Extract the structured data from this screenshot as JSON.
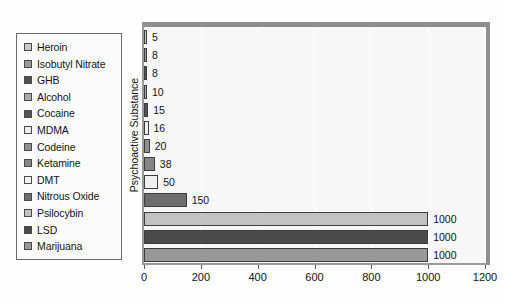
{
  "chart_data": {
    "type": "bar",
    "orientation": "horizontal",
    "title": "",
    "xlabel": "",
    "ylabel": "Psychoactive Substance",
    "xlim": [
      0,
      1200
    ],
    "xticks": [
      0,
      200,
      400,
      600,
      800,
      1000,
      1200
    ],
    "grid": true,
    "legend_position": "left-outside",
    "categories": [
      "Heroin",
      "Isobutyl Nitrate",
      "GHB",
      "Alcohol",
      "Cocaine",
      "MDMA",
      "Codeine",
      "Ketamine",
      "DMT",
      "Nitrous Oxide",
      "Psilocybin",
      "LSD",
      "Marijuana"
    ],
    "values": [
      5,
      8,
      8,
      10,
      15,
      16,
      20,
      38,
      50,
      150,
      1000,
      1000,
      1000
    ],
    "value_labels": [
      "5",
      "8",
      "8",
      "10",
      "15",
      "16",
      "20",
      "38",
      "50",
      "150",
      "1000",
      "1000",
      "1000"
    ],
    "bar_colors": [
      "#c8c8c8",
      "#9a9a9a",
      "#4f4f4f",
      "#a8a8a8",
      "#555555",
      "#ededed",
      "#8f8f8f",
      "#858585",
      "#f0f0f0",
      "#6d6d6d",
      "#c2c2c2",
      "#4a4a4a",
      "#989898"
    ]
  },
  "legend": {
    "items": [
      {
        "label": "Heroin",
        "color": "#c8c8c8"
      },
      {
        "label": "Isobutyl Nitrate",
        "color": "#9a9a9a"
      },
      {
        "label": "GHB",
        "color": "#4f4f4f"
      },
      {
        "label": "Alcohol",
        "color": "#a8a8a8"
      },
      {
        "label": "Cocaine",
        "color": "#555555"
      },
      {
        "label": "MDMA",
        "color": "#ededed"
      },
      {
        "label": "Codeine",
        "color": "#8f8f8f"
      },
      {
        "label": "Ketamine",
        "color": "#858585"
      },
      {
        "label": "DMT",
        "color": "#f0f0f0"
      },
      {
        "label": "Nitrous Oxide",
        "color": "#6d6d6d"
      },
      {
        "label": "Psilocybin",
        "color": "#c2c2c2"
      },
      {
        "label": "LSD",
        "color": "#4a4a4a"
      },
      {
        "label": "Marijuana",
        "color": "#989898"
      }
    ]
  },
  "colors": {
    "plot_background": "#f7f7f7",
    "frame": "#8e8e8e",
    "axis": "#5a5a5a",
    "gridline": "#ffffff",
    "text": "#141414",
    "bar_outline": "#3d3d3d"
  }
}
